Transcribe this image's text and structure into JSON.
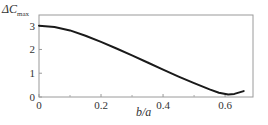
{
  "chart_data": {
    "type": "line",
    "title": "",
    "xlabel": "b/a",
    "ylabel": "ΔC_max",
    "xlim": [
      0,
      0.69
    ],
    "ylim": [
      0,
      3.45
    ],
    "xticks": [
      0,
      0.2,
      0.4,
      0.6
    ],
    "xtick_labels": [
      "0",
      "0.2",
      "0.4",
      "0.6"
    ],
    "yticks": [
      0,
      1,
      2,
      3
    ],
    "ytick_labels": [
      "0",
      "1",
      "2",
      "3"
    ],
    "grid": false,
    "legend": null,
    "series": [
      {
        "name": "ΔC_max",
        "x": [
          0,
          0.05,
          0.1,
          0.15,
          0.2,
          0.25,
          0.3,
          0.35,
          0.4,
          0.45,
          0.5,
          0.55,
          0.58,
          0.61,
          0.63,
          0.66
        ],
        "y": [
          3.0,
          2.94,
          2.8,
          2.58,
          2.32,
          2.04,
          1.75,
          1.45,
          1.15,
          0.86,
          0.58,
          0.32,
          0.18,
          0.1,
          0.13,
          0.25
        ]
      }
    ]
  },
  "labels": {
    "ylabel_main": "ΔC",
    "ylabel_sub": "max",
    "xlabel": "b/a"
  }
}
